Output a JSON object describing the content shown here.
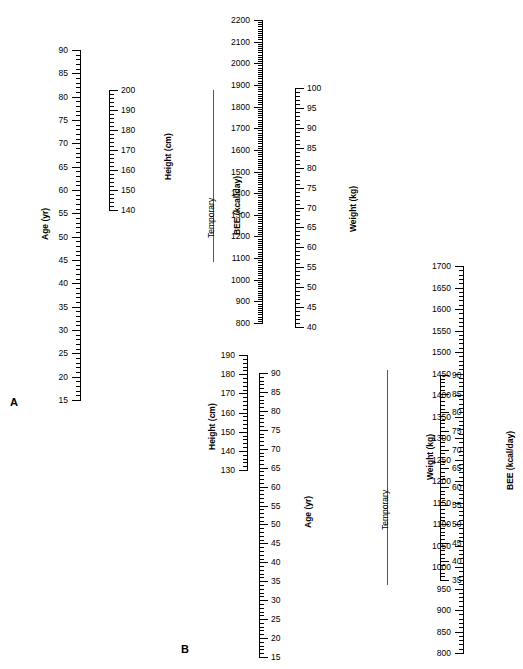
{
  "figure": {
    "panels": [
      {
        "letter": "A",
        "letter_pos": {
          "x": 10,
          "y": 397
        },
        "temporary": {
          "label": "Temporary",
          "x": 213,
          "y_top": 90,
          "y_bottom": 262,
          "label_x": 206,
          "label_y": 238
        },
        "scales": [
          {
            "name": "age-scale-a",
            "title": "Age (yr)",
            "unit": "yr",
            "x": 80,
            "y_top": 50,
            "y_bottom": 400,
            "value_top": 90,
            "value_bottom": 15,
            "tick_side": "left",
            "major_step": 5,
            "minor_step": 1,
            "major_len": 9,
            "minor_len": 5,
            "label_offset": 12,
            "title_x": 40,
            "title_y": 240,
            "labels": [
              90,
              85,
              80,
              75,
              70,
              65,
              60,
              55,
              50,
              45,
              40,
              35,
              30,
              25,
              20,
              15
            ]
          },
          {
            "name": "height-scale-a",
            "title": "Height (cm)",
            "unit": "cm",
            "x": 109,
            "y_top": 90,
            "y_bottom": 210,
            "value_top": 200,
            "value_bottom": 140,
            "tick_side": "right",
            "major_step": 10,
            "minor_step": 2,
            "major_len": 9,
            "minor_len": 5,
            "label_offset": 12,
            "title_x": 163,
            "title_y": 180,
            "labels": [
              200,
              190,
              180,
              170,
              160,
              150,
              140
            ]
          },
          {
            "name": "bee-scale-a",
            "title": "BEE (kcal/day)",
            "unit": "kcal/day",
            "x": 262,
            "y_top": 20,
            "y_bottom": 323,
            "value_top": 2200,
            "value_bottom": 800,
            "tick_side": "left",
            "major_step": 100,
            "minor_step": 10,
            "major_len": 9,
            "minor_len": 5,
            "label_offset": 12,
            "title_x": 232,
            "title_y": 235,
            "labels": [
              2200,
              2100,
              2000,
              1900,
              1800,
              1700,
              1600,
              1500,
              1400,
              1300,
              1200,
              1100,
              1000,
              900,
              800
            ]
          },
          {
            "name": "weight-scale-a",
            "title": "Weight (kg)",
            "unit": "kg",
            "x": 295,
            "y_top": 88,
            "y_bottom": 327,
            "value_top": 100,
            "value_bottom": 40,
            "tick_side": "right",
            "major_step": 5,
            "minor_step": 1,
            "major_len": 9,
            "minor_len": 5,
            "label_offset": 12,
            "title_x": 348,
            "title_y": 232,
            "labels": [
              100,
              95,
              90,
              85,
              80,
              75,
              70,
              65,
              60,
              55,
              50,
              45,
              40
            ]
          }
        ]
      },
      {
        "letter": "B",
        "letter_pos": {
          "x": 181,
          "y": 644
        },
        "temporary": {
          "label": "Temporary",
          "x": 387,
          "y_top": 370,
          "y_bottom": 585,
          "label_x": 380,
          "label_y": 530
        },
        "scales": [
          {
            "name": "height-scale-b",
            "title": "Height (cm)",
            "unit": "cm",
            "x": 247,
            "y_top": 355,
            "y_bottom": 470,
            "value_top": 190,
            "value_bottom": 130,
            "tick_side": "left",
            "major_step": 10,
            "minor_step": 2,
            "major_len": 9,
            "minor_len": 5,
            "label_offset": 12,
            "title_x": 207,
            "title_y": 450,
            "labels": [
              190,
              180,
              170,
              160,
              150,
              140,
              130
            ]
          },
          {
            "name": "age-scale-b",
            "title": "Age (yr)",
            "unit": "yr",
            "x": 259,
            "y_top": 373,
            "y_bottom": 657,
            "value_top": 90,
            "value_bottom": 15,
            "tick_side": "right",
            "major_step": 5,
            "minor_step": 1,
            "major_len": 9,
            "minor_len": 5,
            "label_offset": 12,
            "title_x": 303,
            "title_y": 528,
            "labels": [
              90,
              85,
              80,
              75,
              70,
              65,
              60,
              55,
              50,
              45,
              40,
              35,
              30,
              25,
              20,
              15
            ]
          },
          {
            "name": "weight-scale-b",
            "title": "Weight (kg)",
            "unit": "kg",
            "x": 440,
            "y_top": 375,
            "y_bottom": 580,
            "value_top": 90,
            "value_bottom": 35,
            "tick_side": "right",
            "major_step": 5,
            "minor_step": 1,
            "major_len": 9,
            "minor_len": 5,
            "label_offset": 12,
            "title_x": 425,
            "title_y": 480,
            "labels": [
              90,
              85,
              80,
              75,
              70,
              65,
              60,
              55,
              50,
              45,
              40,
              35
            ]
          },
          {
            "name": "bee-scale-b",
            "title": "BEE (kcal/day)",
            "unit": "kcal/day",
            "x": 463,
            "y_top": 266,
            "y_bottom": 653,
            "value_top": 1700,
            "value_bottom": 800,
            "tick_side": "left",
            "major_step": 50,
            "minor_step": 10,
            "major_len": 9,
            "minor_len": 5,
            "label_offset": 12,
            "title_x": 505,
            "title_y": 490,
            "labels": [
              1700,
              1650,
              1600,
              1550,
              1500,
              1450,
              1400,
              1350,
              1300,
              1250,
              1200,
              1150,
              1100,
              1050,
              1000,
              950,
              900,
              850,
              800
            ]
          }
        ]
      }
    ]
  }
}
